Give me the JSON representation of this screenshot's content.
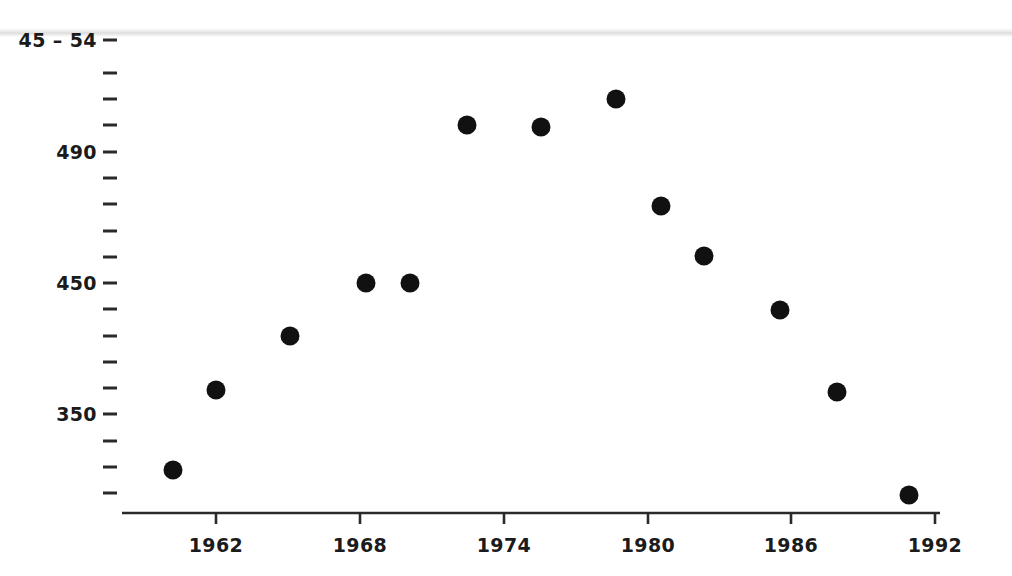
{
  "chart_data": {
    "type": "scatter",
    "title": "",
    "subtitle": "",
    "xlabel": "",
    "ylabel": "",
    "grid": false,
    "legend": null,
    "marker": {
      "shape": "circle",
      "color": "#111111",
      "size_px": 19
    },
    "axis_color": "#2a2a2a",
    "background": "#ffffff",
    "xlim": [
      1959.0,
      1992.6
    ],
    "ylim": [
      305,
      570
    ],
    "x_tick_labels": [
      "1962",
      "1968",
      "1974",
      "1980",
      "1986",
      "1992"
    ],
    "x_tick_values": [
      1962,
      1968,
      1974,
      1980,
      1986,
      1992
    ],
    "x_minor_ticks": false,
    "y_tick_labels": [
      "45 – 54",
      "490",
      "450",
      "350"
    ],
    "y_labeled_values": [
      554,
      490,
      450,
      350
    ],
    "y_minor_tick_count": 16,
    "note_top_label_is_clipped": "45 – 54",
    "x": [
      1960.2,
      1962.0,
      1965.1,
      1968.2,
      1970.1,
      1972.5,
      1973.6,
      1976.7,
      1978.9,
      1980.3,
      1982.1,
      1985.7,
      1987.8,
      1990.0
    ],
    "y": [
      315,
      371,
      410,
      450,
      450,
      505,
      504,
      525,
      494,
      475,
      439,
      405,
      371,
      329
    ],
    "points": [
      {
        "x": 1960.2,
        "y": 315,
        "px": 173,
        "py": 470
      },
      {
        "x": 1962.0,
        "y": 371,
        "px": 216,
        "py": 390
      },
      {
        "x": 1965.1,
        "y": 410,
        "px": 290,
        "py": 336
      },
      {
        "x": 1968.2,
        "y": 450,
        "px": 366,
        "py": 283
      },
      {
        "x": 1970.1,
        "y": 450,
        "px": 410,
        "py": 283
      },
      {
        "x": 1972.5,
        "y": 505,
        "px": 467,
        "py": 125
      },
      {
        "x": 1973.6,
        "y": 504,
        "px": 541,
        "py": 127
      },
      {
        "x": 1976.7,
        "y": 525,
        "px": 616,
        "py": 99
      },
      {
        "x": 1978.9,
        "y": 494,
        "px": 661,
        "py": 206
      },
      {
        "x": 1980.3,
        "y": 475,
        "px": 704,
        "py": 256
      },
      {
        "x": 1982.1,
        "y": 439,
        "px": 780,
        "py": 310
      },
      {
        "x": 1985.7,
        "y": 405,
        "px": 837,
        "py": 392
      },
      {
        "x": 1987.8,
        "y": 371,
        "px": 909,
        "py": 495
      },
      {
        "x": 1990.0,
        "y": 329,
        "px": 909,
        "py": 495
      }
    ],
    "marker_pixels": [
      [
        173,
        470
      ],
      [
        216,
        390
      ],
      [
        290,
        336
      ],
      [
        366,
        283
      ],
      [
        410,
        283
      ],
      [
        467,
        125
      ],
      [
        541,
        127
      ],
      [
        616,
        99
      ],
      [
        661,
        206
      ],
      [
        704,
        256
      ],
      [
        780,
        310
      ],
      [
        837,
        392
      ],
      [
        909,
        495
      ]
    ]
  },
  "axes": {
    "y_ticks": [
      {
        "label": "45 – 54",
        "py": 40,
        "major": true
      },
      {
        "label": "",
        "py": 73,
        "major": false
      },
      {
        "label": "",
        "py": 99,
        "major": false
      },
      {
        "label": "",
        "py": 125,
        "major": false
      },
      {
        "label": "490",
        "py": 152,
        "major": true
      },
      {
        "label": "",
        "py": 178,
        "major": false
      },
      {
        "label": "",
        "py": 204,
        "major": false
      },
      {
        "label": "",
        "py": 231,
        "major": false
      },
      {
        "label": "",
        "py": 257,
        "major": false
      },
      {
        "label": "450",
        "py": 283,
        "major": true
      },
      {
        "label": "",
        "py": 309,
        "major": false
      },
      {
        "label": "",
        "py": 336,
        "major": false
      },
      {
        "label": "",
        "py": 362,
        "major": false
      },
      {
        "label": "",
        "py": 388,
        "major": false
      },
      {
        "label": "350",
        "py": 414,
        "major": true
      },
      {
        "label": "",
        "py": 441,
        "major": false
      },
      {
        "label": "",
        "py": 467,
        "major": false
      },
      {
        "label": "",
        "py": 493,
        "major": false
      }
    ],
    "x_ticks": [
      {
        "label": "1962",
        "px": 216
      },
      {
        "label": "1968",
        "px": 360
      },
      {
        "label": "1974",
        "px": 504
      },
      {
        "label": "1980",
        "px": 648
      },
      {
        "label": "1986",
        "px": 791
      },
      {
        "label": "1992",
        "px": 935
      }
    ],
    "x_axis_line": {
      "x1": 122,
      "x2": 940,
      "y": 513
    },
    "y_tick_mark_x_end": 117,
    "y_tick_mark_x_start": 103
  },
  "artifacts": {
    "scan_band_y": 32
  }
}
